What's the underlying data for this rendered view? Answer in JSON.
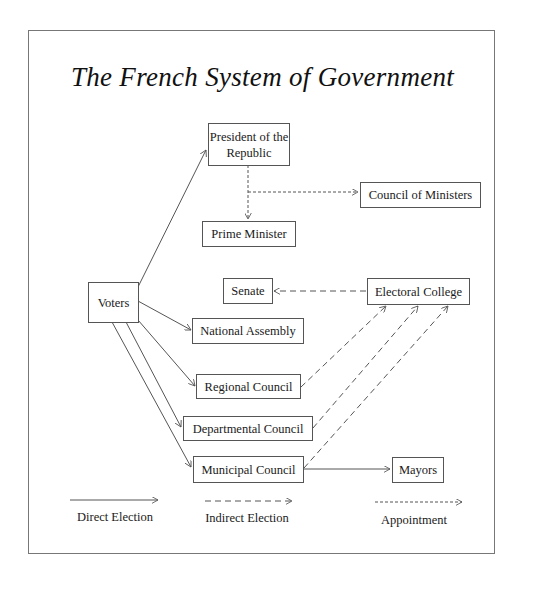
{
  "title": "The French System of Government",
  "nodes": {
    "president": "President of the Republic",
    "council_of_ministers": "Council of Ministers",
    "prime_minister": "Prime Minister",
    "voters": "Voters",
    "senate": "Senate",
    "electoral_college": "Electoral College",
    "national_assembly": "National Assembly",
    "regional_council": "Regional Council",
    "departmental_council": "Departmental Council",
    "municipal_council": "Municipal Council",
    "mayors": "Mayors"
  },
  "edges": [
    {
      "from": "voters",
      "to": "president",
      "type": "direct"
    },
    {
      "from": "voters",
      "to": "national_assembly",
      "type": "direct"
    },
    {
      "from": "voters",
      "to": "regional_council",
      "type": "direct"
    },
    {
      "from": "voters",
      "to": "departmental_council",
      "type": "direct"
    },
    {
      "from": "voters",
      "to": "municipal_council",
      "type": "direct"
    },
    {
      "from": "municipal_council",
      "to": "mayors",
      "type": "direct"
    },
    {
      "from": "president",
      "to": "prime_minister",
      "type": "appointment"
    },
    {
      "from": "president",
      "to": "council_of_ministers",
      "type": "appointment"
    },
    {
      "from": "electoral_college",
      "to": "senate",
      "type": "indirect"
    },
    {
      "from": "regional_council",
      "to": "electoral_college",
      "type": "indirect"
    },
    {
      "from": "departmental_council",
      "to": "electoral_college",
      "type": "indirect"
    },
    {
      "from": "municipal_council",
      "to": "electoral_college",
      "type": "indirect"
    }
  ],
  "legend": {
    "direct": "Direct Election",
    "indirect": "Indirect Election",
    "appointment": "Appointment"
  },
  "colors": {
    "line": "#555555",
    "frame": "#777777",
    "text": "#1a1a1a"
  }
}
